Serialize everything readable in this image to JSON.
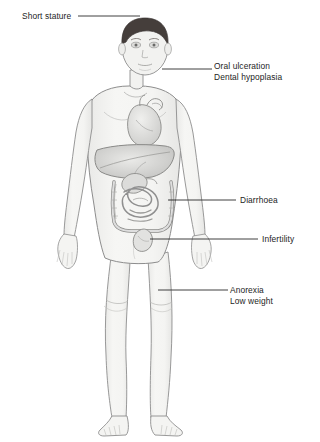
{
  "figure": {
    "colors": {
      "background": "#ffffff",
      "skin_fill": "#f2f2f0",
      "outline": "#8d8d8d",
      "hair": "#4a4340",
      "organ_fill": "#d8d8d6",
      "organ_outline": "#8a8a88",
      "liver_fill": "#c9c9c7",
      "leader_line": "#2a2a2a",
      "text": "#1d1d1d"
    },
    "organs": [
      "heart",
      "liver",
      "stomach",
      "large-intestine",
      "small-intestine",
      "bladder"
    ]
  },
  "labels": [
    {
      "id": "short-stature",
      "lines": [
        "Short stature"
      ],
      "leader": {
        "x1": 78,
        "y1": 16,
        "x2": 140,
        "y2": 16
      }
    },
    {
      "id": "oral-ulceration",
      "lines": [
        "Oral ulceration",
        "Dental hypoplasia"
      ],
      "leader": {
        "x1": 162,
        "y1": 69,
        "x2": 212,
        "y2": 69
      }
    },
    {
      "id": "diarrhoea",
      "lines": [
        "Diarrhoea"
      ],
      "leader": {
        "x1": 168,
        "y1": 200,
        "x2": 236,
        "y2": 200
      }
    },
    {
      "id": "infertility",
      "lines": [
        "Infertility"
      ],
      "leader": {
        "x1": 150,
        "y1": 239,
        "x2": 258,
        "y2": 239
      }
    },
    {
      "id": "anorexia",
      "lines": [
        "Anorexia",
        "Low weight"
      ],
      "leader": {
        "x1": 158,
        "y1": 290,
        "x2": 228,
        "y2": 290
      }
    }
  ],
  "text": {
    "short_stature": "Short stature",
    "oral_ulceration": "Oral ulceration",
    "dental_hypoplasia": "Dental hypoplasia",
    "diarrhoea": "Diarrhoea",
    "infertility": "Infertility",
    "anorexia": "Anorexia",
    "low_weight": "Low weight"
  }
}
